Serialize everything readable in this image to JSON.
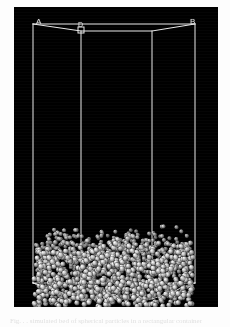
{
  "figure": {
    "panel_background": "#000000",
    "wire_color": "#e6e6e6",
    "particle_color": "#cfcfcf",
    "page_background": "#fdfdfd"
  },
  "labels": {
    "vertex_a": "A",
    "vertex_d": "D",
    "vertex_b": "B"
  },
  "caption": {
    "text": "Fig.  . .  simulated bed of  spherical particles in a rectangular container"
  },
  "chart_data": {
    "type": "scatter",
    "xlabel": "",
    "ylabel": "",
    "grid": false,
    "legend": "none",
    "projection": "3d-perspective-wireframe",
    "box": {
      "label_vertices": [
        "A",
        "D",
        "B"
      ],
      "front_face_verticals_x": [
        33,
        81,
        152,
        195
      ],
      "back_top_y": 24,
      "front_top_y": 31,
      "back_bottom_y": 283,
      "front_bottom_y": 300,
      "left_x": 33,
      "right_x": 195
    },
    "particles": {
      "count": 1400,
      "radius_px": 2.6,
      "bed_top_y": 232,
      "bed_bottom_y": 303,
      "fill_fraction_of_box_height": 0.26,
      "shading": "diffuse-sphere-highlight-upper-left"
    },
    "axis_ranges": {
      "x": [
        0,
        204
      ],
      "y": [
        0,
        300
      ]
    }
  }
}
